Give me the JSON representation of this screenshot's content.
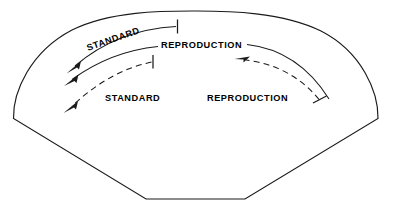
{
  "figure": {
    "type": "process-flow-diagram",
    "shape_name": "fan-sector-outline",
    "background_color": "#ffffff",
    "line_color": "#1a1a1a",
    "labels": {
      "standard_upper": "STANDARD",
      "reproduction_upper": "REPRODUCTION",
      "standard_lower": "STANDARD",
      "reproduction_lower": "REPRODUCTION"
    },
    "arcs": [
      {
        "name": "standard-upper-arc",
        "label": "STANDARD",
        "style": "solid",
        "direction": "leftward",
        "terminator": "tick",
        "arrowhead": "left-end"
      },
      {
        "name": "reproduction-upper-arc",
        "label": "REPRODUCTION",
        "style": "solid",
        "direction": "leftward",
        "terminator": "tick",
        "arrowhead": "left-end"
      },
      {
        "name": "standard-lower-arc",
        "label": "STANDARD",
        "style": "dashed",
        "direction": "leftward",
        "terminator": "tick",
        "arrowhead": "left-end"
      },
      {
        "name": "reproduction-lower-arc",
        "label": "REPRODUCTION",
        "style": "dashed",
        "direction": "leftward",
        "terminator": "tick",
        "arrowhead": "left-end"
      }
    ]
  }
}
